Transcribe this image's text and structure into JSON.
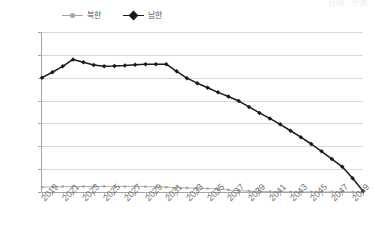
{
  "corner_note": {
    "text": "(단위 : 만명)"
  },
  "legend": {
    "position": "top-left",
    "items": [
      {
        "label": "북한",
        "color": "#a6a6a6",
        "marker": "circle",
        "name": "series-north"
      },
      {
        "label": "남한",
        "color": "#1a1a1a",
        "marker": "diamond",
        "name": "series-south"
      }
    ]
  },
  "axes": {
    "y_ticks": [
      "350.0",
      "300.0",
      "250.0",
      "200.0",
      "150.0",
      "100.0",
      "50.0",
      "0"
    ],
    "x_ticks": [
      "2019",
      "2021",
      "2023",
      "2025",
      "2027",
      "2029",
      "2031",
      "2033",
      "2035",
      "2037",
      "2039",
      "2041",
      "2043",
      "2045",
      "2047",
      "2049"
    ]
  },
  "chart_data": {
    "type": "line",
    "title": "",
    "subtitle": "",
    "xlabel": "",
    "ylabel": "",
    "annotation": "(단위 : 만명)",
    "grid": true,
    "legend_position": "top-left",
    "ylim": [
      0,
      350
    ],
    "ytick_step": 50,
    "xlim": [
      2019,
      2050
    ],
    "xtick_step": 2,
    "x": [
      2019,
      2020,
      2021,
      2022,
      2023,
      2024,
      2025,
      2026,
      2027,
      2028,
      2029,
      2030,
      2031,
      2032,
      2033,
      2034,
      2035,
      2036,
      2037,
      2038,
      2039,
      2040,
      2041,
      2042,
      2043,
      2044,
      2045,
      2046,
      2047,
      2048,
      2049,
      2050
    ],
    "categories": [
      "2019",
      "2020",
      "2021",
      "2022",
      "2023",
      "2024",
      "2025",
      "2026",
      "2027",
      "2028",
      "2029",
      "2030",
      "2031",
      "2032",
      "2033",
      "2034",
      "2035",
      "2036",
      "2037",
      "2038",
      "2039",
      "2040",
      "2041",
      "2042",
      "2043",
      "2044",
      "2045",
      "2046",
      "2047",
      "2048",
      "2049",
      "2050"
    ],
    "series": [
      {
        "name": "북한",
        "color": "#a6a6a6",
        "marker": "circle",
        "values": [
          10.5,
          11.3,
          11.8,
          12.0,
          12.0,
          12.0,
          12.1,
          12.2,
          12.2,
          12.0,
          11.8,
          11.4,
          10.6,
          9.6,
          8.8,
          8.2,
          7.6,
          6.4,
          4.6,
          3.0,
          1.8,
          1.0,
          0.6,
          0.4,
          0.3,
          0.2,
          0.2,
          0.2,
          0.1,
          0.1,
          0.1,
          0.0
        ]
      },
      {
        "name": "남한",
        "color": "#1a1a1a",
        "marker": "diamond",
        "values": [
          250.0,
          262.0,
          275.0,
          290.0,
          284.0,
          278.0,
          275.0,
          275.5,
          276.5,
          278.5,
          279.5,
          279.5,
          279.5,
          264.0,
          249.0,
          238.0,
          228.0,
          218.0,
          209.0,
          199.0,
          186.0,
          173.0,
          161.0,
          148.0,
          134.0,
          120.0,
          105.0,
          89.0,
          72.0,
          55.0,
          30.0,
          2.0
        ]
      }
    ]
  }
}
